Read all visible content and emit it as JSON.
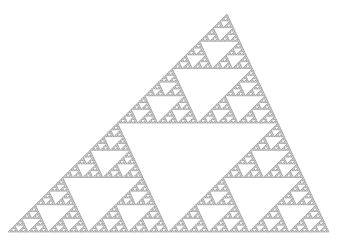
{
  "figure": {
    "background_color": "#ffffff",
    "stroke_color": "#8a8a8a",
    "vertices": {
      "apex": [
        227,
        14
      ],
      "bottom_left": [
        8,
        232
      ],
      "bottom_right": [
        329,
        232
      ]
    },
    "recursion_depth": 7
  }
}
